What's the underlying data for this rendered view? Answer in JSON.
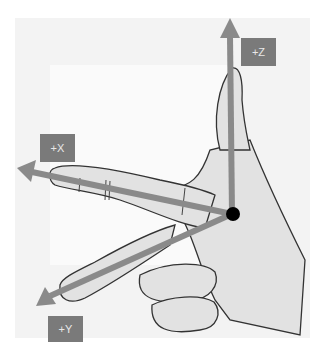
{
  "diagram": {
    "colors": {
      "arrow": "#8a8a8a",
      "label_bg": "#7a7a7a",
      "label_text": "#e8e8e8",
      "origin": "#000000",
      "sketch_bg": "#f2f2f2"
    },
    "axes": [
      {
        "id": "z",
        "label": "+Z",
        "direction": "up (thumb)"
      },
      {
        "id": "x",
        "label": "+X",
        "direction": "left (index finger)"
      },
      {
        "id": "y",
        "label": "+Y",
        "direction": "down-left (middle finger)"
      }
    ],
    "origin": {
      "label": "",
      "shape": "filled-circle"
    }
  }
}
